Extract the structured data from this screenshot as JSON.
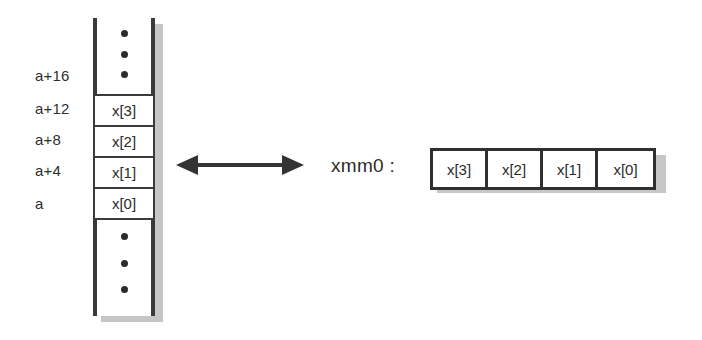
{
  "diagram": {
    "memory": {
      "address_labels": [
        {
          "text": "a+16"
        },
        {
          "text": "a+12"
        },
        {
          "text": "a+8"
        },
        {
          "text": "a+4"
        },
        {
          "text": "a"
        }
      ],
      "cells": [
        {
          "text": "x[3]"
        },
        {
          "text": "x[2]"
        },
        {
          "text": "x[1]"
        },
        {
          "text": "x[0]"
        }
      ],
      "ellipsis_top": {
        "name": "vertical-ellipsis",
        "dots": 3
      },
      "ellipsis_bottom": {
        "name": "vertical-ellipsis",
        "dots": 3
      }
    },
    "connector": {
      "name": "bidirectional-arrow",
      "direction": "both"
    },
    "register": {
      "label": "xmm0 :",
      "lanes": [
        {
          "text": "x[3]"
        },
        {
          "text": "x[2]"
        },
        {
          "text": "x[1]"
        },
        {
          "text": "x[0]"
        }
      ]
    },
    "colors": {
      "ink": "#2b2b2b",
      "border": "#3a3a3a",
      "shadow": "#c6c6c6",
      "background": "#ffffff"
    }
  }
}
